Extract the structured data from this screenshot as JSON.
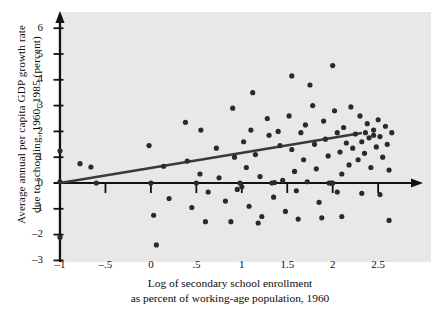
{
  "chart_data": {
    "type": "scatter",
    "title": "",
    "xlabel": "Log of secondary school enrollment as percent of working-age population, 1960",
    "xlabel_line1": "Log of secondary school enrollment",
    "xlabel_line2": "as percent of working-age population, 1960",
    "ylabel": "Average annual per capita GDP growth rate due to schooling, 1960–1985 (percent)",
    "ylabel_line1": "Average annual per capita GDP growth rate",
    "ylabel_line2": "due to schooling, 1960–1985 (percent)",
    "xlim": [
      -1.05,
      2.7
    ],
    "ylim": [
      -3.15,
      6.45
    ],
    "xticks": [
      -1,
      -0.5,
      0,
      0.5,
      1,
      1.5,
      2,
      2.5
    ],
    "xtick_labels": [
      "–1",
      "–.5",
      "0",
      ".5",
      "1",
      "1.5",
      "2",
      "2.5"
    ],
    "yticks": [
      -3,
      -2,
      -1,
      0,
      1,
      2,
      3,
      4,
      5,
      6
    ],
    "ytick_labels": [
      "–3",
      "–2",
      "–1",
      "0",
      "1",
      "2",
      "3",
      "4",
      "5",
      "6"
    ],
    "grid": false,
    "legend": "none",
    "marker_color": "#2a2a2a",
    "marker_size": 4.0,
    "axis_color": "#111111",
    "panel_color": "#e8e8e6",
    "trend_color": "#3a3a3a",
    "trendline": {
      "label": "fitted regression line",
      "x_start": -1.0,
      "y_start": 0.0,
      "x_end": 2.32,
      "y_end": 1.94
    },
    "points": [
      [
        -1.0,
        1.25
      ],
      [
        -1.0,
        0.05
      ],
      [
        -1.0,
        -2.1
      ],
      [
        -0.78,
        0.75
      ],
      [
        -0.66,
        0.62
      ],
      [
        -0.6,
        0.0
      ],
      [
        -0.02,
        1.45
      ],
      [
        0.0,
        0.0
      ],
      [
        0.03,
        -1.25
      ],
      [
        0.06,
        -2.4
      ],
      [
        0.14,
        0.65
      ],
      [
        0.2,
        -0.6
      ],
      [
        0.38,
        2.35
      ],
      [
        0.4,
        0.85
      ],
      [
        0.45,
        -0.95
      ],
      [
        0.5,
        0.0
      ],
      [
        0.54,
        0.35
      ],
      [
        0.6,
        -1.5
      ],
      [
        0.63,
        -0.35
      ],
      [
        0.72,
        1.35
      ],
      [
        0.75,
        0.2
      ],
      [
        0.82,
        -0.7
      ],
      [
        0.9,
        2.9
      ],
      [
        0.92,
        1.0
      ],
      [
        0.95,
        -0.25
      ],
      [
        0.98,
        0.0
      ],
      [
        1.0,
        -0.15
      ],
      [
        1.02,
        1.6
      ],
      [
        1.05,
        0.6
      ],
      [
        1.08,
        -0.9
      ],
      [
        1.12,
        3.5
      ],
      [
        1.15,
        1.1
      ],
      [
        1.2,
        0.25
      ],
      [
        1.22,
        -1.3
      ],
      [
        1.28,
        2.5
      ],
      [
        1.3,
        1.85
      ],
      [
        1.33,
        0.0
      ],
      [
        1.35,
        -0.55
      ],
      [
        1.4,
        2.0
      ],
      [
        1.42,
        1.45
      ],
      [
        1.45,
        0.1
      ],
      [
        1.48,
        -1.1
      ],
      [
        1.52,
        2.6
      ],
      [
        1.55,
        1.3
      ],
      [
        1.58,
        0.45
      ],
      [
        1.6,
        -0.3
      ],
      [
        1.65,
        1.95
      ],
      [
        1.68,
        0.9
      ],
      [
        1.7,
        2.25
      ],
      [
        1.72,
        0.05
      ],
      [
        1.78,
        3.0
      ],
      [
        1.8,
        1.5
      ],
      [
        1.82,
        0.55
      ],
      [
        1.85,
        -0.75
      ],
      [
        1.9,
        2.4
      ],
      [
        1.92,
        1.7
      ],
      [
        1.95,
        1.05
      ],
      [
        1.98,
        0.0
      ],
      [
        2.0,
        4.55
      ],
      [
        2.02,
        2.8
      ],
      [
        2.05,
        1.95
      ],
      [
        2.08,
        1.2
      ],
      [
        2.1,
        0.35
      ],
      [
        2.12,
        2.15
      ],
      [
        2.15,
        1.55
      ],
      [
        2.18,
        0.7
      ],
      [
        2.2,
        2.95
      ],
      [
        2.22,
        1.35
      ],
      [
        2.25,
        1.9
      ],
      [
        2.28,
        0.9
      ],
      [
        2.3,
        2.6
      ],
      [
        2.32,
        1.6
      ],
      [
        2.35,
        1.15
      ],
      [
        2.38,
        2.3
      ],
      [
        2.4,
        1.75
      ],
      [
        2.42,
        0.6
      ],
      [
        2.45,
        2.05
      ],
      [
        2.48,
        1.4
      ],
      [
        2.5,
        2.45
      ],
      [
        2.52,
        1.8
      ],
      [
        2.55,
        1.0
      ],
      [
        2.58,
        2.2
      ],
      [
        2.6,
        1.5
      ],
      [
        2.62,
        0.5
      ],
      [
        2.65,
        1.95
      ],
      [
        1.55,
        4.15
      ],
      [
        1.75,
        3.8
      ],
      [
        0.55,
        2.05
      ],
      [
        1.1,
        2.05
      ],
      [
        2.05,
        -0.35
      ],
      [
        2.32,
        -0.4
      ],
      [
        2.52,
        -0.45
      ],
      [
        1.88,
        -1.35
      ],
      [
        2.1,
        -1.3
      ],
      [
        1.62,
        -1.4
      ],
      [
        0.88,
        -1.5
      ],
      [
        1.18,
        -1.55
      ],
      [
        2.62,
        -1.45
      ],
      [
        1.36,
        0.02
      ],
      [
        1.96,
        0.0
      ],
      [
        2.0,
        0.0
      ],
      [
        2.36,
        1.95
      ],
      [
        2.45,
        1.85
      ]
    ]
  }
}
